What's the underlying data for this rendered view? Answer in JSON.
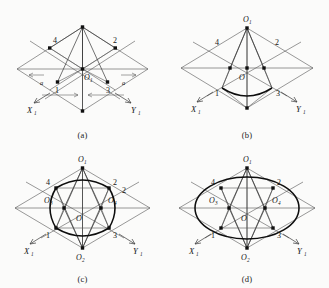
{
  "figure": {
    "background_color": "#fbfbfa",
    "line_color": "#3c3c3c",
    "bold_curve_color": "#0d0d0d",
    "node_color": "#101010",
    "panels": [
      {
        "id": "a",
        "caption": "(a)",
        "axis_x": "X",
        "axis_x_sub": "1",
        "axis_y": "Y",
        "axis_y_sub": "1",
        "center_label": "O",
        "center_sub": "1",
        "numbers": [
          "4",
          "2",
          "1",
          "3"
        ],
        "dimension_labels": [
          "a",
          "a"
        ]
      },
      {
        "id": "b",
        "caption": "(b)",
        "axis_x": "X",
        "axis_x_sub": "1",
        "axis_y": "Y",
        "axis_y_sub": "1",
        "apex_label": "O",
        "apex_sub": "1",
        "center_label": "O",
        "numbers": [
          "4",
          "2",
          "1",
          "3"
        ]
      },
      {
        "id": "c",
        "caption": "(c)",
        "axis_x": "X",
        "axis_x_sub": "1",
        "axis_y": "Y",
        "axis_y_sub": "1",
        "apex_label": "O",
        "apex_sub": "1",
        "bottom_label": "O",
        "bottom_sub": "2",
        "left_label": "O",
        "left_sub": "3",
        "right_label": "O",
        "right_sub": "4",
        "center_label": "O",
        "numbers": [
          "4",
          "2",
          "2",
          "1",
          "3"
        ]
      },
      {
        "id": "d",
        "caption": "(d)",
        "axis_x": "X",
        "axis_x_sub": "1",
        "axis_y": "Y",
        "axis_y_sub": "1",
        "apex_label": "O",
        "apex_sub": "1",
        "bottom_label": "O",
        "bottom_sub": "2",
        "left_label": "O",
        "left_sub": "3",
        "right_label": "O",
        "right_sub": "4",
        "center_label": "O",
        "numbers": [
          "4",
          "2",
          "1",
          "3"
        ]
      }
    ]
  }
}
